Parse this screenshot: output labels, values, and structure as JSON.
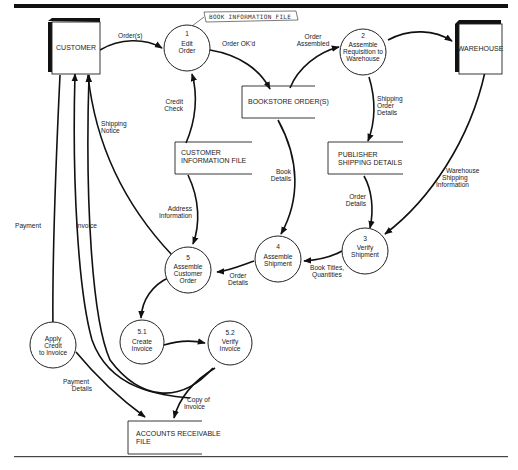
{
  "diagram": {
    "type": "data-flow-diagram",
    "annotation": "BOOK INFORMATION FILE",
    "external_entities": [
      {
        "id": "customer",
        "label": "CUSTOMER"
      },
      {
        "id": "warehouse",
        "label": "WAREHOUSE"
      }
    ],
    "processes": [
      {
        "id": "p1",
        "number": "1",
        "lines": [
          "Edit",
          "Order"
        ]
      },
      {
        "id": "p2",
        "number": "2",
        "lines": [
          "Assemble",
          "Requisition to",
          "Warehouse"
        ]
      },
      {
        "id": "p3",
        "number": "3",
        "lines": [
          "Verify",
          "Shipment"
        ]
      },
      {
        "id": "p4",
        "number": "4",
        "lines": [
          "Assemble",
          "Shipment"
        ]
      },
      {
        "id": "p5",
        "number": "5",
        "lines": [
          "Assemble",
          "Customer",
          "Order"
        ]
      },
      {
        "id": "p51",
        "number": "5.1",
        "lines": [
          "Create",
          "Invoice"
        ]
      },
      {
        "id": "p52",
        "number": "5.2",
        "lines": [
          "Verify",
          "Invoice"
        ]
      },
      {
        "id": "pac",
        "number": "",
        "lines": [
          "Apply",
          "Credit",
          "to Invoice"
        ]
      }
    ],
    "data_stores": [
      {
        "id": "bookstore",
        "lines": [
          "BOOKSTORE ORDER(S)"
        ]
      },
      {
        "id": "custinfo",
        "lines": [
          "CUSTOMER",
          "INFORMATION FILE"
        ]
      },
      {
        "id": "pubship",
        "lines": [
          "PUBLISHER",
          "SHIPPING DETAILS"
        ]
      },
      {
        "id": "ar",
        "lines": [
          "ACCOUNTS RECEIVABLE",
          "FILE"
        ]
      }
    ],
    "flows": [
      {
        "id": "f_orders",
        "lines": [
          "Order(s)"
        ],
        "from": "customer",
        "to": "p1"
      },
      {
        "id": "f_orderok",
        "lines": [
          "Order OK'd"
        ],
        "from": "p1",
        "to": "bookstore"
      },
      {
        "id": "f_orderassembled",
        "lines": [
          "Order",
          "Assembled"
        ],
        "from": "bookstore",
        "to": "p2"
      },
      {
        "id": "f_req",
        "lines": [],
        "from": "p2",
        "to": "warehouse"
      },
      {
        "id": "f_creditcheck",
        "lines": [
          "Credit",
          "Check"
        ],
        "from": "custinfo",
        "to": "p1"
      },
      {
        "id": "f_shipnotice",
        "lines": [
          "Shipping",
          "Notice"
        ],
        "from": "p5",
        "to": "customer"
      },
      {
        "id": "f_shiporder",
        "lines": [
          "Shipping",
          "Order",
          "Details"
        ],
        "from": "p2",
        "to": "pubship"
      },
      {
        "id": "f_bookdetails",
        "lines": [
          "Book",
          "Details"
        ],
        "from": "bookstore",
        "to": "p4"
      },
      {
        "id": "f_whship",
        "lines": [
          "Warehouse",
          "Shipping",
          "Information"
        ],
        "from": "warehouse",
        "to": "p3"
      },
      {
        "id": "f_orderdetails1",
        "lines": [
          "Order",
          "Details"
        ],
        "from": "pubship",
        "to": "p3"
      },
      {
        "id": "f_addrinfo",
        "lines": [
          "Address",
          "Information"
        ],
        "from": "custinfo",
        "to": "p5"
      },
      {
        "id": "f_booktitles",
        "lines": [
          "Book Titles,",
          "Quantities"
        ],
        "from": "p3",
        "to": "p4"
      },
      {
        "id": "f_orderdetails2",
        "lines": [
          "Order",
          "Details"
        ],
        "from": "p4",
        "to": "p5"
      },
      {
        "id": "f_payment",
        "lines": [
          "Payment"
        ],
        "from": "customer",
        "to": "pac"
      },
      {
        "id": "f_invoice",
        "lines": [
          "Invoice"
        ],
        "from": "p52",
        "to": "customer"
      },
      {
        "id": "f_p5_p51",
        "lines": [],
        "from": "p5",
        "to": "p51"
      },
      {
        "id": "f_p51_p52",
        "lines": [],
        "from": "p51",
        "to": "p52"
      },
      {
        "id": "f_paydetails",
        "lines": [
          "Payment",
          "Details"
        ],
        "from": "pac",
        "to": "ar"
      },
      {
        "id": "f_copyinvoice",
        "lines": [
          "Copy of",
          "Invoice"
        ],
        "from": "p52",
        "to": "ar"
      }
    ]
  }
}
